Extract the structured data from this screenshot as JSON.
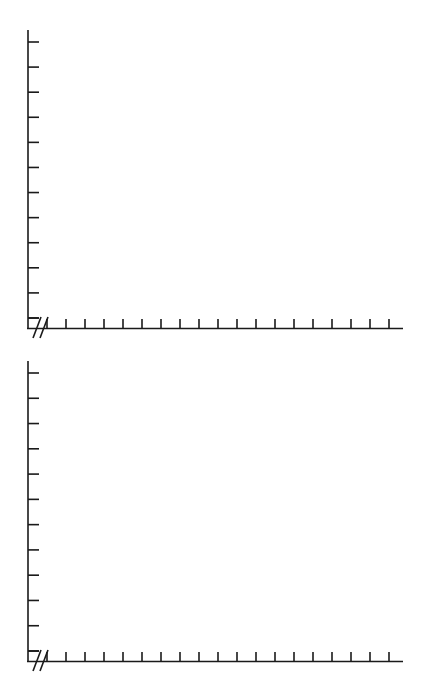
{
  "figure": {
    "title": "",
    "background_color": "#ffffff",
    "line_color": "#1a1a1a",
    "panel_count": 2
  },
  "chart_data": [
    {
      "type": "line",
      "title": "",
      "subtitle": "",
      "xlabel": "",
      "ylabel": "",
      "panel_label": "Top panel",
      "series": [],
      "categories": [],
      "x": [],
      "values": [],
      "grid": false,
      "legend": "none",
      "annotations": [
        "axis-break"
      ],
      "axes": {
        "x": {
          "tick_count": 19,
          "tick_direction": "up",
          "tick_length_px": 9,
          "axis_break": true,
          "break_symbol": "//",
          "tick_labels": [],
          "range_start_px": 47,
          "range_end_px": 389,
          "axis_end_px": 403,
          "baseline_y_px": 328,
          "origin_x_px": 28
        },
        "y": {
          "tick_count": 13,
          "tick_direction": "right",
          "tick_length_px": 11,
          "tick_labels": [],
          "top_px": 30,
          "bottom_px": 328,
          "axis_x_px": 28
        }
      }
    },
    {
      "type": "line",
      "title": "",
      "subtitle": "",
      "xlabel": "",
      "ylabel": "",
      "panel_label": "Bottom panel",
      "series": [],
      "categories": [],
      "x": [],
      "values": [],
      "grid": false,
      "legend": "none",
      "annotations": [
        "axis-break"
      ],
      "axes": {
        "x": {
          "tick_count": 19,
          "tick_direction": "up",
          "tick_length_px": 9,
          "axis_break": true,
          "break_symbol": "//",
          "tick_labels": [],
          "range_start_px": 47,
          "range_end_px": 389,
          "axis_end_px": 403,
          "baseline_y_px": 661,
          "origin_x_px": 28
        },
        "y": {
          "tick_count": 13,
          "tick_direction": "right",
          "tick_length_px": 11,
          "tick_labels": [],
          "top_px": 361,
          "bottom_px": 661,
          "axis_x_px": 28
        }
      }
    }
  ]
}
